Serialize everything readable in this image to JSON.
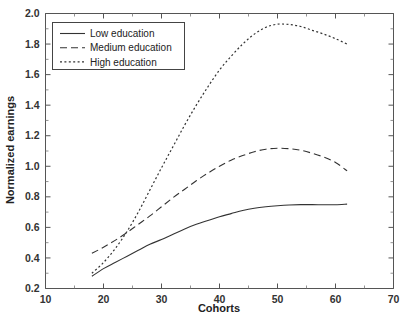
{
  "chart_data": {
    "type": "line",
    "title": "",
    "xlabel": "Cohorts",
    "ylabel": "Normalized earnings",
    "xlim": [
      10,
      70
    ],
    "ylim": [
      0.2,
      2.0
    ],
    "xticks": [
      10,
      20,
      30,
      40,
      50,
      60,
      70
    ],
    "xtick_labels": [
      "10",
      "20",
      "30",
      "40",
      "50",
      "60",
      "70"
    ],
    "xticks_minor": [
      15,
      25,
      35,
      45,
      55,
      65
    ],
    "yticks": [
      0.2,
      0.4,
      0.6,
      0.8,
      1.0,
      1.2,
      1.4,
      1.6,
      1.8,
      2.0
    ],
    "ytick_labels": [
      "0.2",
      "0.4",
      "0.6",
      "0.8",
      "1.0",
      "1.2",
      "1.4",
      "1.6",
      "1.8",
      "2.0"
    ],
    "yticks_minor": [
      0.3,
      0.5,
      0.7,
      0.9,
      1.1,
      1.3,
      1.5,
      1.7,
      1.9
    ],
    "grid": false,
    "legend_position": "upper left",
    "x": [
      18,
      20,
      22,
      24,
      26,
      28,
      30,
      32,
      34,
      36,
      38,
      40,
      42,
      44,
      46,
      48,
      50,
      52,
      54,
      56,
      58,
      60,
      62
    ],
    "series": [
      {
        "name": "Low education",
        "style": "solid",
        "color": "#333333",
        "values": [
          0.28,
          0.33,
          0.37,
          0.41,
          0.45,
          0.49,
          0.52,
          0.555,
          0.59,
          0.62,
          0.645,
          0.67,
          0.69,
          0.71,
          0.725,
          0.735,
          0.742,
          0.747,
          0.749,
          0.749,
          0.748,
          0.748,
          0.752
        ]
      },
      {
        "name": "Medium education",
        "style": "dashed",
        "color": "#333333",
        "values": [
          0.43,
          0.47,
          0.515,
          0.565,
          0.62,
          0.675,
          0.735,
          0.795,
          0.85,
          0.905,
          0.955,
          1.0,
          1.04,
          1.07,
          1.095,
          1.112,
          1.118,
          1.115,
          1.105,
          1.085,
          1.06,
          1.025,
          0.97
        ]
      },
      {
        "name": "High education",
        "style": "dotted",
        "color": "#333333",
        "values": [
          0.3,
          0.37,
          0.46,
          0.57,
          0.7,
          0.845,
          0.99,
          1.13,
          1.27,
          1.4,
          1.52,
          1.63,
          1.72,
          1.8,
          1.865,
          1.91,
          1.93,
          1.928,
          1.915,
          1.89,
          1.865,
          1.835,
          1.8
        ]
      }
    ],
    "legend_entries": [
      "Low education",
      "Medium education",
      "High education"
    ],
    "annotations": {
      "caption": ""
    }
  }
}
